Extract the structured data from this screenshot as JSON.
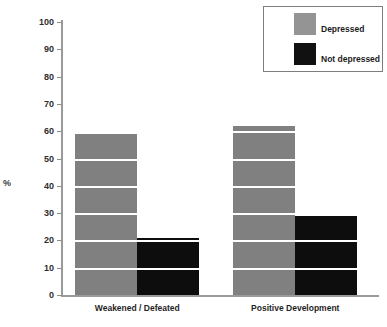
{
  "chart_data": {
    "type": "bar",
    "title": "",
    "xlabel": "",
    "ylabel": "%",
    "ylim": [
      0,
      100
    ],
    "yticks": [
      0,
      10,
      20,
      30,
      40,
      50,
      60,
      70,
      80,
      90,
      100
    ],
    "ytick_labels": [
      "0",
      "10",
      "20",
      "30",
      "40",
      "50",
      "60",
      "70",
      "80",
      "90",
      "100"
    ],
    "grid": true,
    "grid_color": "#ffffff",
    "legend_position": "top-right",
    "categories": [
      "Weakened / Defeated",
      "Positive Development"
    ],
    "series": [
      {
        "name": "Depressed",
        "color": "#808080",
        "values": [
          59,
          62
        ]
      },
      {
        "name": "Not depressed",
        "color": "#0d0d0d",
        "values": [
          21,
          29
        ]
      }
    ]
  },
  "legend": {
    "items": [
      {
        "label": "Depressed",
        "color": "#949494"
      },
      {
        "label": "Not depressed",
        "color": "#111111"
      }
    ]
  },
  "axis": {
    "y_title": "%"
  }
}
